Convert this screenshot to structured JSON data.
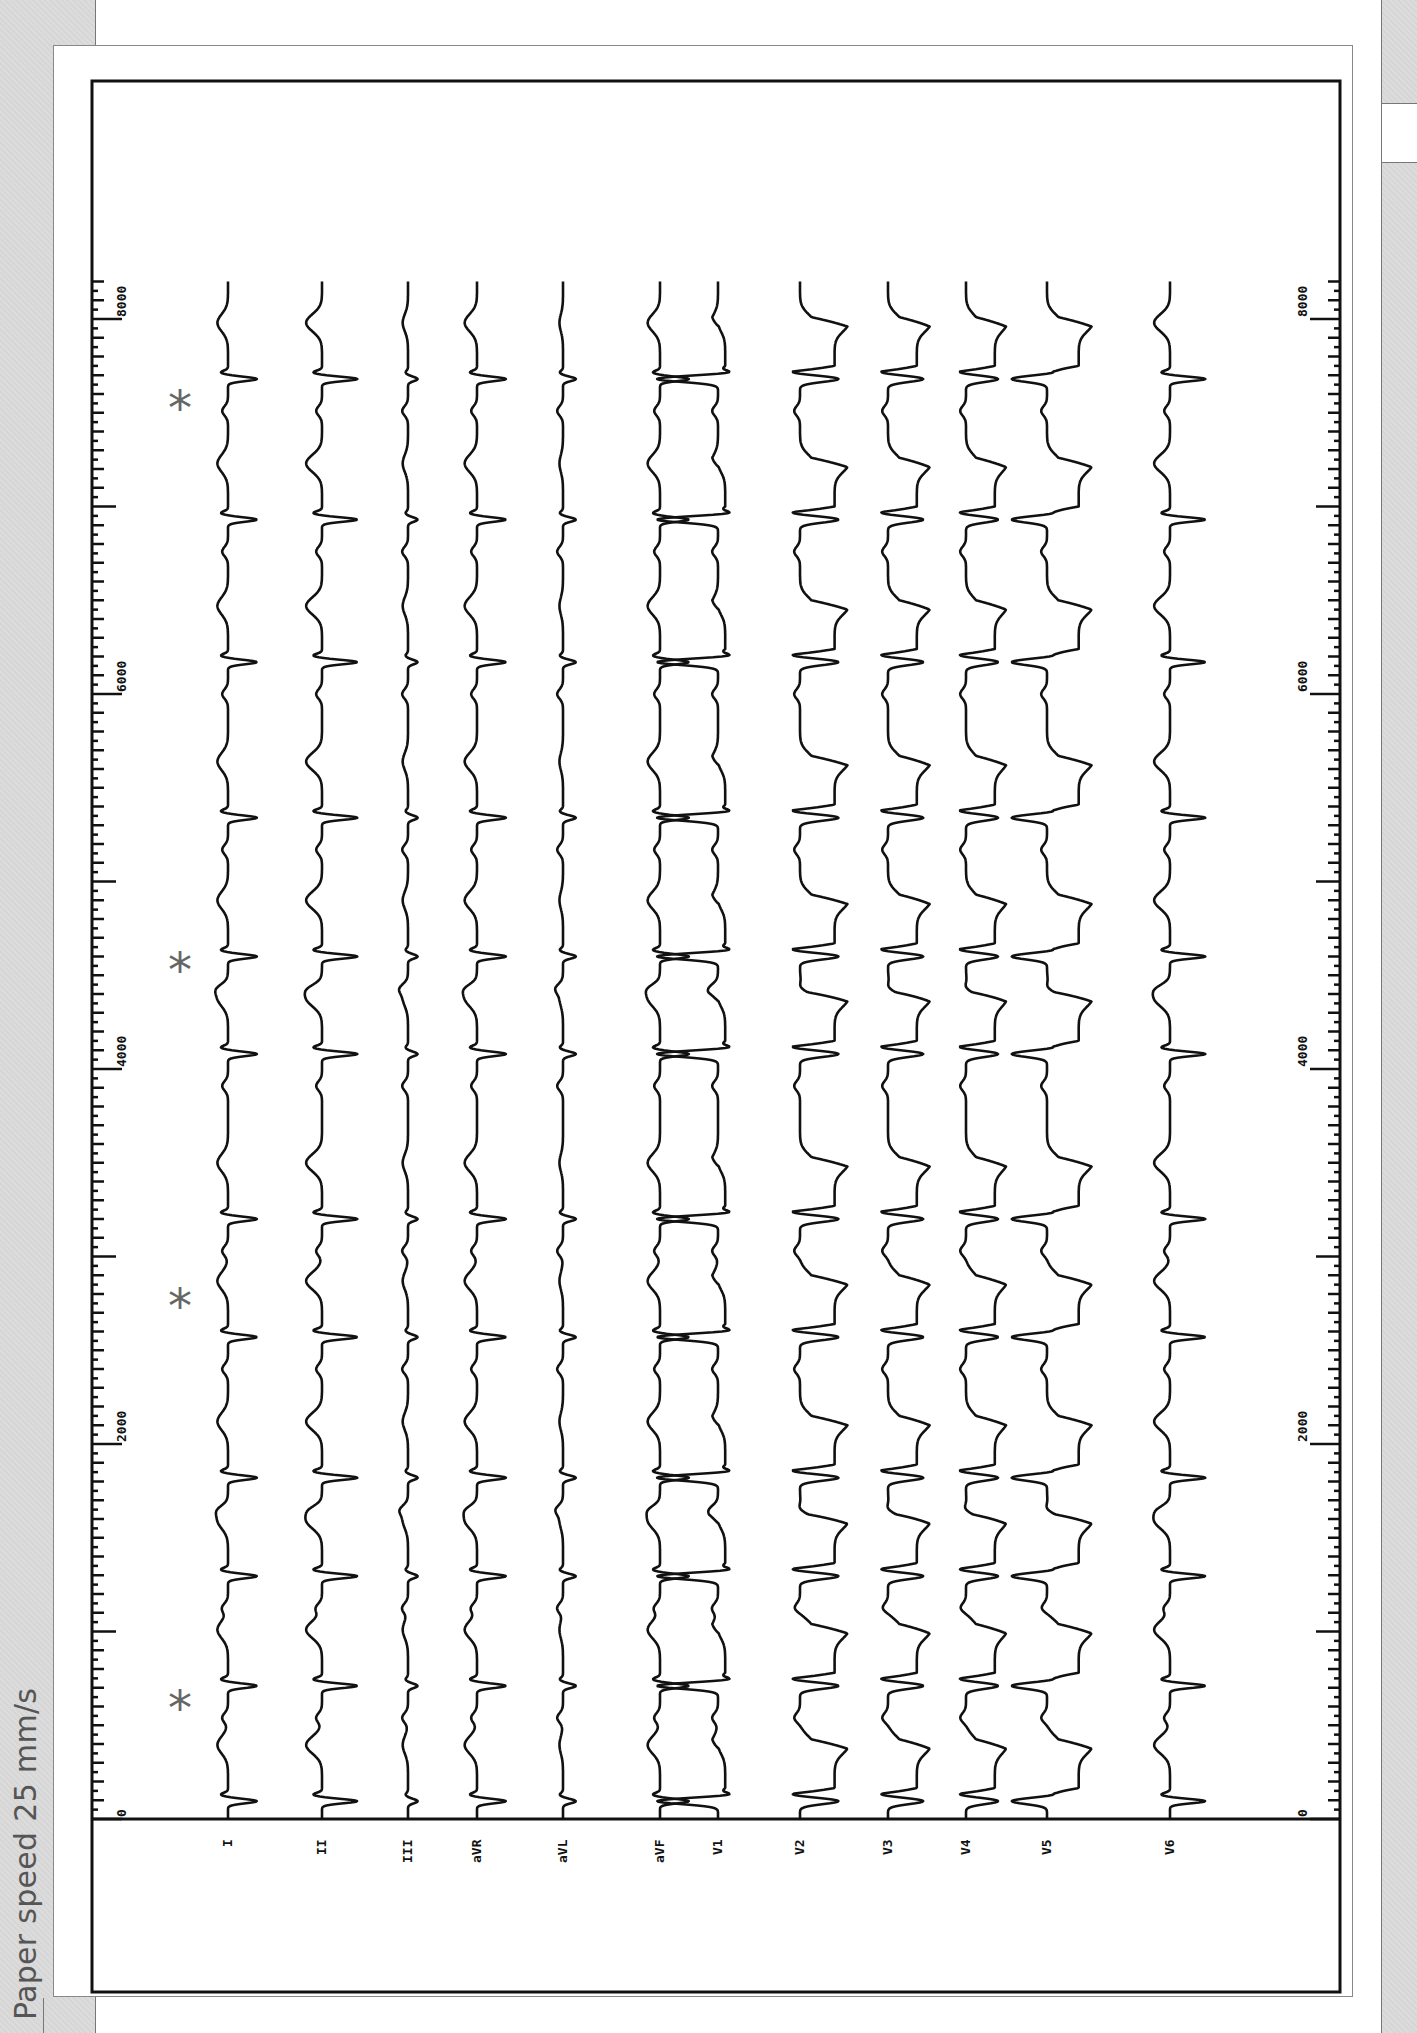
{
  "caption": "Paper speed 25 mm/s",
  "chart_data": {
    "type": "line",
    "xlabel": "Time (ms)",
    "ylabel": "",
    "time_axis": {
      "ticks": [
        0,
        2000,
        4000,
        6000,
        8000
      ],
      "tick_labels": [
        "0",
        "2000",
        "4000",
        "6000",
        "8000"
      ],
      "minor_tick_ms": 100,
      "major_tick_ms": 500,
      "range_ms": [
        0,
        8200
      ]
    },
    "grid": false,
    "leads": [
      "I",
      "II",
      "III",
      "aVR",
      "aVL",
      "aVF",
      "V1",
      "V2",
      "V3",
      "V4",
      "V5",
      "V6"
    ],
    "qrs_times_ms": [
      95,
      710,
      1295,
      1820,
      2570,
      3200,
      4080,
      4600,
      5340,
      6170,
      6930,
      7680
    ],
    "p_wave_markers_ms": [
      625,
      2770,
      4560,
      7555
    ],
    "marker_symbol": "*"
  },
  "layout": {
    "px_per_ms": 0.1875,
    "time_zero_y": 1819,
    "frame": {
      "left": 92,
      "top": 81,
      "right": 1340,
      "bottom": 1992
    },
    "label_row_y": 1819,
    "lead_baselines_x": [
      228,
      322,
      408,
      477,
      563,
      660,
      718,
      800,
      888,
      966,
      1047,
      1170
    ],
    "marker_x": 182
  },
  "leads": [
    {
      "name": "I",
      "label": "I",
      "qrs": -0.9,
      "t": 0.6,
      "st": 0,
      "wide": false
    },
    {
      "name": "II",
      "label": "II",
      "qrs": -1.1,
      "t": 0.9,
      "st": 0,
      "wide": false
    },
    {
      "name": "III",
      "label": "III",
      "qrs": -0.3,
      "t": 0.3,
      "st": 0,
      "wide": false
    },
    {
      "name": "aVR",
      "label": "aVR",
      "qrs": -0.9,
      "t": 0.7,
      "st": 0,
      "wide": false
    },
    {
      "name": "aVL",
      "label": "aVL",
      "qrs": -0.4,
      "t": 0.2,
      "st": 0,
      "wide": false
    },
    {
      "name": "aVF",
      "label": "aVF",
      "qrs": -0.9,
      "t": 0.7,
      "st": 0,
      "wide": false
    },
    {
      "name": "V1",
      "label": "V1",
      "qrs": 1.9,
      "t": 0.4,
      "st": 0.5,
      "wide": true
    },
    {
      "name": "V2",
      "label": "V2",
      "qrs": -1.2,
      "t": -0.8,
      "st": 2.4,
      "wide": true
    },
    {
      "name": "V3",
      "label": "V3",
      "qrs": -1.1,
      "t": -0.8,
      "st": 2.0,
      "wide": true
    },
    {
      "name": "V4",
      "label": "V4",
      "qrs": -1.0,
      "t": -0.7,
      "st": 2.0,
      "wide": true
    },
    {
      "name": "V5",
      "label": "V5",
      "qrs": 1.1,
      "t": -0.8,
      "st": 2.2,
      "wide": true
    },
    {
      "name": "V6",
      "label": "V6",
      "qrs": -1.1,
      "t": 0.9,
      "st": 0,
      "wide": false
    }
  ],
  "colors": {
    "trace": "#111111",
    "frame": "#111111",
    "marker": "#666666",
    "caption": "#555555",
    "background": "#d9d9d9"
  }
}
